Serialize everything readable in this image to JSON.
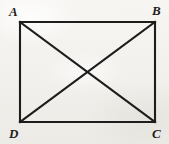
{
  "figure": {
    "kind": "geometry-diagram",
    "shape": "rectangle",
    "background_color": "#f3f2ef",
    "stroke_color": "#1d1d1d",
    "stroke_width": 2,
    "ghost_text": "",
    "vertices": [
      {
        "id": "A",
        "label": "A",
        "x": 20,
        "y": 22,
        "corner": "top-left"
      },
      {
        "id": "B",
        "label": "B",
        "x": 155,
        "y": 22,
        "corner": "top-right"
      },
      {
        "id": "C",
        "label": "C",
        "x": 155,
        "y": 122,
        "corner": "bottom-right"
      },
      {
        "id": "D",
        "label": "D",
        "x": 20,
        "y": 122,
        "corner": "bottom-left"
      }
    ],
    "edges": [
      {
        "id": "AB",
        "from": "A",
        "to": "B",
        "role": "side-top"
      },
      {
        "id": "BC",
        "from": "B",
        "to": "C",
        "role": "side-right"
      },
      {
        "id": "CD",
        "from": "C",
        "to": "D",
        "role": "side-bottom"
      },
      {
        "id": "DA",
        "from": "D",
        "to": "A",
        "role": "side-left"
      },
      {
        "id": "AC",
        "from": "A",
        "to": "C",
        "role": "diagonal"
      },
      {
        "id": "BD",
        "from": "B",
        "to": "D",
        "role": "diagonal"
      }
    ],
    "intersection": {
      "id": "O",
      "label": "",
      "x": 87,
      "y": 72
    }
  }
}
